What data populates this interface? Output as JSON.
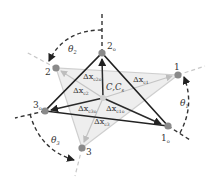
{
  "diagram": {
    "type": "rotation-triangle",
    "colors": {
      "dark_edge": "#222222",
      "light_edge": "#c8c8c8",
      "fill_light": "#ececec",
      "node": "#8a8a8a",
      "center_node": "#d0d0d0",
      "dashed": "#333333",
      "dashed_light": "#c0c0c0"
    },
    "nodes": {
      "n1o": {
        "label_main": "1",
        "label_sub": "o"
      },
      "n2o": {
        "label_main": "2",
        "label_sub": "o"
      },
      "n3o": {
        "label_main": "3",
        "label_sub": "o"
      },
      "n1": {
        "label_main": "1"
      },
      "n2": {
        "label_main": "2"
      },
      "n3": {
        "label_main": "3"
      },
      "center": {
        "label_main": "C,C",
        "label_sub": "s"
      }
    },
    "angles": [
      {
        "id": "theta2",
        "main": "θ",
        "sub": "2"
      },
      {
        "id": "theta1",
        "main": "θ",
        "sub": "1"
      },
      {
        "id": "theta3",
        "main": "θ",
        "sub": "3"
      }
    ],
    "vectors": [
      {
        "id": "x_c2o",
        "main": "Δx",
        "sub": "c2o"
      },
      {
        "id": "x_c2",
        "main": "Δx",
        "sub": "c2"
      },
      {
        "id": "x_c1",
        "main": "Δx",
        "sub": "c1"
      },
      {
        "id": "x_c3o",
        "main": "Δx",
        "sub": "c3o"
      },
      {
        "id": "x_c1o",
        "main": "Δx",
        "sub": "c1o"
      },
      {
        "id": "x_c3",
        "main": "Δx",
        "sub": "c3"
      }
    ]
  }
}
